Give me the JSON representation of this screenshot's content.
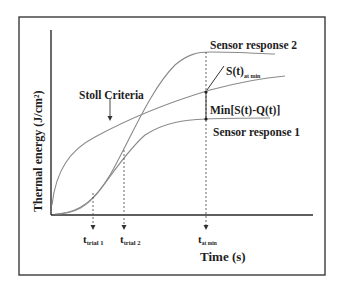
{
  "diagram": {
    "y_axis_label": "Thermal energy (J/cm²)",
    "x_axis_label": "Time (s)",
    "curves": {
      "stoll": {
        "label": "Stoll Criteria",
        "color": "#8a8a8a"
      },
      "sensor2": {
        "label": "Sensor response 2",
        "color": "#8a8a8a"
      },
      "sensor1": {
        "label": "Sensor response 1",
        "color": "#8a8a8a"
      }
    },
    "annotations": {
      "s_at_min": {
        "main": "S(t)",
        "sub": "at min"
      },
      "min_diff": "Min[S(t)-Q(t)]"
    },
    "time_markers": [
      {
        "main": "t",
        "sub": "trial 1"
      },
      {
        "main": "t",
        "sub": "trial 2"
      },
      {
        "main": "t",
        "sub": "at min"
      }
    ],
    "colors": {
      "axis": "#2a2a2a",
      "frame": "#3a3a3a",
      "curve": "#8a8a8a",
      "text": "#1e1e1e"
    }
  }
}
